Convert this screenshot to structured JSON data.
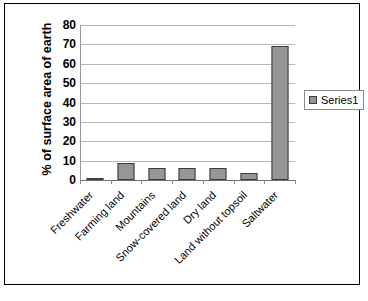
{
  "chart_data": {
    "type": "bar",
    "title": "",
    "xlabel": "",
    "ylabel": "% of surface area of earth",
    "ylim": [
      0,
      80
    ],
    "ytick_step": 10,
    "yticks": [
      80,
      70,
      60,
      50,
      40,
      30,
      20,
      10,
      0
    ],
    "grid": true,
    "legend_position": "right",
    "categories": [
      "Freshwater",
      "Farming land",
      "Mountains",
      "Snow-covered land",
      "Dry land",
      "Land without topsoil",
      "Saltwater"
    ],
    "series": [
      {
        "name": "Series1",
        "values": [
          1,
          9,
          6,
          6,
          6,
          3.5,
          69
        ]
      }
    ]
  },
  "legend": {
    "entries": [
      {
        "label": "Series1"
      }
    ]
  },
  "colors": {
    "bar_fill": "#969696",
    "bar_border": "#3d3d3d",
    "gridline": "#b8b8b8",
    "axis": "#6e6e6e",
    "frame": "#000000",
    "text": "#000000",
    "plot_background": "#ffffff"
  },
  "caption": ""
}
